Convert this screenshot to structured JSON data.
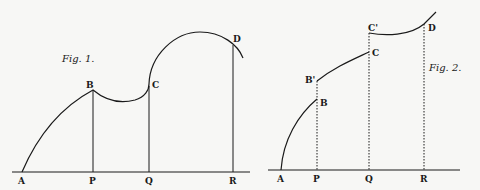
{
  "fig1": {
    "caption": "Fig. 1.",
    "points": {
      "A": "A",
      "P": "P",
      "Q": "Q",
      "R": "R",
      "B": "B",
      "C": "C",
      "D": "D"
    }
  },
  "fig2": {
    "caption": "Fig. 2.",
    "points": {
      "A": "A",
      "P": "P",
      "Q": "Q",
      "R": "R",
      "B": "B",
      "B_prime": "B'",
      "C": "C",
      "C_prime": "C'",
      "D": "D"
    }
  },
  "colors": {
    "ink": "#1a1a1a",
    "paper": "#f7f7f5"
  }
}
